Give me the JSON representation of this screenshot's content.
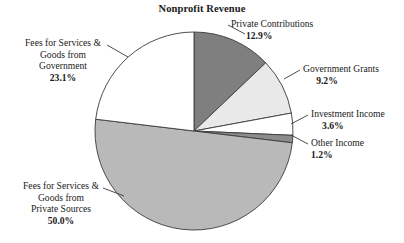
{
  "chart_data": {
    "type": "pie",
    "title": "Nonprofit Revenue",
    "xlabel": "",
    "ylabel": "",
    "legend_position": "none",
    "grid": false,
    "units": "percent",
    "start_angle_deg": 0,
    "direction": "clockwise",
    "categories": [
      "Private Contributions",
      "Government Grants",
      "Investment Income",
      "Other Income",
      "Fees for Services & Goods from Private Sources",
      "Fees for Services & Goods from Government"
    ],
    "values": [
      12.9,
      9.2,
      3.6,
      1.2,
      50.0,
      23.1
    ],
    "slice_colors": [
      "#7f7f7f",
      "#e9e9e9",
      "#ffffff",
      "#8c8c8c",
      "#b9b9b9",
      "#ffffff"
    ],
    "slice_stroke": "#3a3a3a",
    "slices": [
      {
        "label": "Private Contributions",
        "label_line1": "Private Contributions",
        "label_line2": "",
        "label_line3": "",
        "percent": "12.9%",
        "value": 12.9,
        "color": "#7f7f7f"
      },
      {
        "label": "Government Grants",
        "label_line1": "Government Grants",
        "label_line2": "",
        "label_line3": "",
        "percent": "9.2%",
        "value": 9.2,
        "color": "#e9e9e9"
      },
      {
        "label": "Investment Income",
        "label_line1": "Investment Income",
        "label_line2": "",
        "label_line3": "",
        "percent": "3.6%",
        "value": 3.6,
        "color": "#ffffff"
      },
      {
        "label": "Other Income",
        "label_line1": "Other Income",
        "label_line2": "",
        "label_line3": "",
        "percent": "1.2%",
        "value": 1.2,
        "color": "#8c8c8c"
      },
      {
        "label": "Fees for Services & Goods from Private Sources",
        "label_line1": "Fees for Services &",
        "label_line2": "Goods from",
        "label_line3": "Private Sources",
        "percent": "50.0%",
        "value": 50.0,
        "color": "#b9b9b9"
      },
      {
        "label": "Fees for Services & Goods from Government",
        "label_line1": "Fees for Services &",
        "label_line2": "Goods from",
        "label_line3": "Government",
        "percent": "23.1%",
        "value": 23.1,
        "color": "#ffffff"
      }
    ]
  }
}
